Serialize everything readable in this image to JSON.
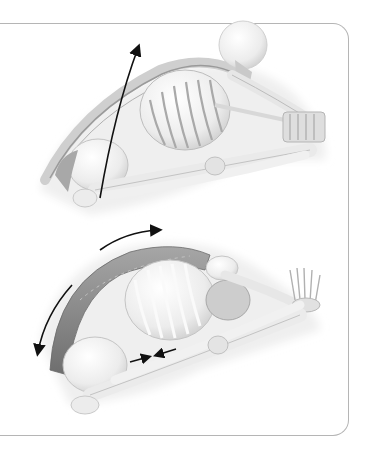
{
  "figure": {
    "panels": [
      {
        "id": "top",
        "caption": "",
        "pose": "seated forward fold, early stage — rounded spine, hands reaching toward feet",
        "highlighted_structure": "spinal extensors (faint)",
        "arrows": [
          {
            "name": "upward-stretch-arrow",
            "direction": "up-right",
            "from": [
              110,
              195
            ],
            "to": [
              138,
              45
            ]
          }
        ]
      },
      {
        "id": "bottom",
        "caption": "",
        "pose": "seated forward fold, deeper stage — torso closer to legs, hands beyond feet",
        "highlighted_structure": "erector spinae / back muscles (shaded)",
        "arrows": [
          {
            "name": "top-forward-arrow",
            "direction": "right",
            "from": [
              100,
              248
            ],
            "to": [
              160,
              230
            ]
          },
          {
            "name": "lower-back-down-arrow",
            "direction": "down",
            "from": [
              70,
              285
            ],
            "to": [
              38,
              353
            ]
          },
          {
            "name": "pelvis-arrow-right",
            "direction": "right",
            "from": [
              130,
              362
            ],
            "to": [
              150,
              356
            ]
          },
          {
            "name": "pelvis-arrow-left",
            "direction": "left",
            "from": [
              175,
              348
            ],
            "to": [
              155,
              355
            ]
          }
        ]
      }
    ],
    "colors": {
      "frame_border": "#b5b5b5",
      "bone_fill": "#f2f2f2",
      "bone_shadow": "#d6d6d6",
      "muscle": "#8f8f8f",
      "arrow": "#111111",
      "background": "#ffffff"
    }
  }
}
